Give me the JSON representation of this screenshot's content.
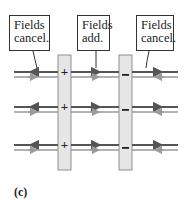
{
  "figure": {
    "caption": "(c)",
    "callouts": [
      {
        "line1": "Fields",
        "line2": "cancel.",
        "region": "left"
      },
      {
        "line1": "Fields",
        "line2": "add.",
        "region": "between"
      },
      {
        "line1": "Fields",
        "line2": "cancel.",
        "region": "right"
      }
    ],
    "plates": [
      {
        "charge_symbol": "+",
        "label": "positive plate"
      },
      {
        "charge_symbol": "–",
        "label": "negative plate"
      }
    ],
    "colors": {
      "positive_field": "#555555",
      "negative_field": "#9a9a9a",
      "plate_fill": "#e6e6e6",
      "plate_stroke": "#666666"
    }
  }
}
